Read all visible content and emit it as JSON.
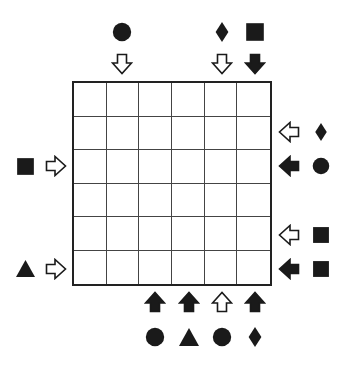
{
  "puzzle": {
    "rows": 6,
    "cols": 6,
    "cells": [
      [
        "",
        "",
        "",
        "",
        "",
        ""
      ],
      [
        "",
        "",
        "",
        "",
        "",
        ""
      ],
      [
        "",
        "",
        "",
        "",
        "",
        ""
      ],
      [
        "",
        "",
        "",
        "",
        "",
        ""
      ],
      [
        "",
        "",
        "",
        "",
        "",
        ""
      ],
      [
        "",
        "",
        "",
        "",
        "",
        ""
      ]
    ],
    "clues": {
      "top": [
        {
          "col": 1,
          "arrow": "hollow",
          "symbol": "circle"
        },
        {
          "col": 4,
          "arrow": "hollow",
          "symbol": "diamond"
        },
        {
          "col": 5,
          "arrow": "filled",
          "symbol": "square"
        }
      ],
      "right": [
        {
          "row": 1,
          "arrow": "hollow",
          "symbol": "diamond"
        },
        {
          "row": 2,
          "arrow": "filled",
          "symbol": "circle"
        },
        {
          "row": 4,
          "arrow": "hollow",
          "symbol": "square"
        },
        {
          "row": 5,
          "arrow": "filled",
          "symbol": "square"
        }
      ],
      "left": [
        {
          "row": 2,
          "arrow": "hollow",
          "symbol": "square"
        },
        {
          "row": 5,
          "arrow": "hollow",
          "symbol": "triangle"
        }
      ],
      "bottom": [
        {
          "col": 2,
          "arrow": "filled",
          "symbol": "circle"
        },
        {
          "col": 3,
          "arrow": "filled",
          "symbol": "triangle"
        },
        {
          "col": 4,
          "arrow": "hollow",
          "symbol": "circle"
        },
        {
          "col": 5,
          "arrow": "filled",
          "symbol": "diamond"
        }
      ]
    }
  },
  "colors": {
    "ink": "#1a1a1a",
    "grid_line": "#444444",
    "background": "#ffffff"
  }
}
